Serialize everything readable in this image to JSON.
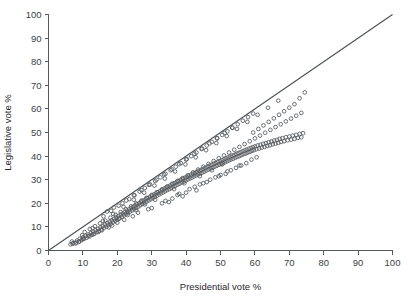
{
  "chart_data": {
    "type": "scatter",
    "title": "",
    "xlabel": "Presidential vote %",
    "ylabel": "Legislative vote %",
    "xlim": [
      0,
      100
    ],
    "ylim": [
      0,
      100
    ],
    "grid": false,
    "legend": null,
    "xticks": [
      0,
      10,
      20,
      30,
      40,
      50,
      60,
      70,
      80,
      90,
      100
    ],
    "yticks": [
      0,
      10,
      20,
      30,
      40,
      50,
      60,
      70,
      80,
      90,
      100
    ],
    "xtick_labels": [
      "0",
      "10",
      "20",
      "30",
      "40",
      "50",
      "60",
      "70",
      "80",
      "90",
      "100"
    ],
    "ytick_labels": [
      "0",
      "10",
      "20",
      "30",
      "40",
      "50",
      "60",
      "70",
      "80",
      "90",
      "100"
    ],
    "annotations": [
      {
        "name": "identity-line",
        "description": "45 degree reference line y = x",
        "from": [
          0,
          0
        ],
        "to": [
          100,
          100
        ]
      }
    ],
    "marker": "open-circle",
    "marker_color": "#54585c",
    "points": [
      [
        6.4,
        2.6
      ],
      [
        7.2,
        3.1
      ],
      [
        7.9,
        3.0
      ],
      [
        8.3,
        4.2
      ],
      [
        8.8,
        3.6
      ],
      [
        9.1,
        5.0
      ],
      [
        9.6,
        4.4
      ],
      [
        10.0,
        5.6
      ],
      [
        10.3,
        4.9
      ],
      [
        10.8,
        6.2
      ],
      [
        11.1,
        5.4
      ],
      [
        11.6,
        6.8
      ],
      [
        11.9,
        6.0
      ],
      [
        12.3,
        7.4
      ],
      [
        12.6,
        6.6
      ],
      [
        13.0,
        8.0
      ],
      [
        13.3,
        7.1
      ],
      [
        13.7,
        8.6
      ],
      [
        14.0,
        7.7
      ],
      [
        14.4,
        9.2
      ],
      [
        14.7,
        8.3
      ],
      [
        15.1,
        9.8
      ],
      [
        15.4,
        8.9
      ],
      [
        15.8,
        10.4
      ],
      [
        16.1,
        9.5
      ],
      [
        16.4,
        11.0
      ],
      [
        16.8,
        10.1
      ],
      [
        17.1,
        11.6
      ],
      [
        17.4,
        10.7
      ],
      [
        17.8,
        12.2
      ],
      [
        18.1,
        11.3
      ],
      [
        18.4,
        12.8
      ],
      [
        18.7,
        11.9
      ],
      [
        19.1,
        13.4
      ],
      [
        19.4,
        12.5
      ],
      [
        19.7,
        14.0
      ],
      [
        20.0,
        13.1
      ],
      [
        20.3,
        14.6
      ],
      [
        20.6,
        13.6
      ],
      [
        21.0,
        15.2
      ],
      [
        21.3,
        14.2
      ],
      [
        21.6,
        15.7
      ],
      [
        21.9,
        14.8
      ],
      [
        22.2,
        16.3
      ],
      [
        22.5,
        15.4
      ],
      [
        22.8,
        16.9
      ],
      [
        23.1,
        15.9
      ],
      [
        23.4,
        17.4
      ],
      [
        23.7,
        16.5
      ],
      [
        24.0,
        18.0
      ],
      [
        24.3,
        17.0
      ],
      [
        24.6,
        18.5
      ],
      [
        24.9,
        17.6
      ],
      [
        25.2,
        19.1
      ],
      [
        25.5,
        18.1
      ],
      [
        25.8,
        19.6
      ],
      [
        26.1,
        18.6
      ],
      [
        26.4,
        20.1
      ],
      [
        26.7,
        19.2
      ],
      [
        27.0,
        20.7
      ],
      [
        27.3,
        19.7
      ],
      [
        27.6,
        21.2
      ],
      [
        27.9,
        20.2
      ],
      [
        28.2,
        21.7
      ],
      [
        28.5,
        20.7
      ],
      [
        28.8,
        22.2
      ],
      [
        29.1,
        21.2
      ],
      [
        29.4,
        22.7
      ],
      [
        29.7,
        21.7
      ],
      [
        30.0,
        23.2
      ],
      [
        30.3,
        22.2
      ],
      [
        30.6,
        23.7
      ],
      [
        30.9,
        22.7
      ],
      [
        31.2,
        24.2
      ],
      [
        31.5,
        23.2
      ],
      [
        31.8,
        24.7
      ],
      [
        32.1,
        23.7
      ],
      [
        32.4,
        25.2
      ],
      [
        32.7,
        24.2
      ],
      [
        33.0,
        25.7
      ],
      [
        33.3,
        24.6
      ],
      [
        33.6,
        26.2
      ],
      [
        33.9,
        25.1
      ],
      [
        34.2,
        26.7
      ],
      [
        34.5,
        25.6
      ],
      [
        34.8,
        27.1
      ],
      [
        35.1,
        26.0
      ],
      [
        35.4,
        27.6
      ],
      [
        35.7,
        26.5
      ],
      [
        36.0,
        28.1
      ],
      [
        36.3,
        27.0
      ],
      [
        36.6,
        28.5
      ],
      [
        36.9,
        27.4
      ],
      [
        37.2,
        29.0
      ],
      [
        37.5,
        27.9
      ],
      [
        37.8,
        29.4
      ],
      [
        38.1,
        28.3
      ],
      [
        38.4,
        29.9
      ],
      [
        38.7,
        28.8
      ],
      [
        39.0,
        30.3
      ],
      [
        39.3,
        29.2
      ],
      [
        39.6,
        30.8
      ],
      [
        39.9,
        29.6
      ],
      [
        40.2,
        31.2
      ],
      [
        40.5,
        30.1
      ],
      [
        40.8,
        31.6
      ],
      [
        41.1,
        30.5
      ],
      [
        41.4,
        32.1
      ],
      [
        41.7,
        30.9
      ],
      [
        42.0,
        32.5
      ],
      [
        42.3,
        31.4
      ],
      [
        42.6,
        32.9
      ],
      [
        42.9,
        31.8
      ],
      [
        43.2,
        33.4
      ],
      [
        43.5,
        32.2
      ],
      [
        43.8,
        33.8
      ],
      [
        44.1,
        32.6
      ],
      [
        44.4,
        34.2
      ],
      [
        44.7,
        33.0
      ],
      [
        45.0,
        34.6
      ],
      [
        45.3,
        33.4
      ],
      [
        45.6,
        35.0
      ],
      [
        45.9,
        33.9
      ],
      [
        46.2,
        35.5
      ],
      [
        46.5,
        34.3
      ],
      [
        46.8,
        35.9
      ],
      [
        47.1,
        34.7
      ],
      [
        47.4,
        36.3
      ],
      [
        47.7,
        35.1
      ],
      [
        48.0,
        36.7
      ],
      [
        48.3,
        35.5
      ],
      [
        48.6,
        37.1
      ],
      [
        48.9,
        35.9
      ],
      [
        49.2,
        37.5
      ],
      [
        49.5,
        36.3
      ],
      [
        49.8,
        37.9
      ],
      [
        50.1,
        36.7
      ],
      [
        50.4,
        38.3
      ],
      [
        50.7,
        37.0
      ],
      [
        51.0,
        38.6
      ],
      [
        51.3,
        37.4
      ],
      [
        51.6,
        39.0
      ],
      [
        51.9,
        37.8
      ],
      [
        52.2,
        39.4
      ],
      [
        52.5,
        38.2
      ],
      [
        52.8,
        39.8
      ],
      [
        53.1,
        38.6
      ],
      [
        53.4,
        40.2
      ],
      [
        53.7,
        38.9
      ],
      [
        54.0,
        40.5
      ],
      [
        54.3,
        39.3
      ],
      [
        54.6,
        40.9
      ],
      [
        54.9,
        39.7
      ],
      [
        55.2,
        41.3
      ],
      [
        55.5,
        40.0
      ],
      [
        55.8,
        41.6
      ],
      [
        56.1,
        40.4
      ],
      [
        56.4,
        42.0
      ],
      [
        56.7,
        40.8
      ],
      [
        57.0,
        42.4
      ],
      [
        57.3,
        41.1
      ],
      [
        57.6,
        42.7
      ],
      [
        57.9,
        41.5
      ],
      [
        58.2,
        43.1
      ],
      [
        58.5,
        41.8
      ],
      [
        58.8,
        43.4
      ],
      [
        59.1,
        42.2
      ],
      [
        59.4,
        43.8
      ],
      [
        59.7,
        42.5
      ],
      [
        60.0,
        44.1
      ],
      [
        60.4,
        42.9
      ],
      [
        60.8,
        44.5
      ],
      [
        61.2,
        43.2
      ],
      [
        61.6,
        44.8
      ],
      [
        62.0,
        43.6
      ],
      [
        62.4,
        45.2
      ],
      [
        62.8,
        43.9
      ],
      [
        63.2,
        45.5
      ],
      [
        63.6,
        44.3
      ],
      [
        64.0,
        45.9
      ],
      [
        64.4,
        44.6
      ],
      [
        64.8,
        46.2
      ],
      [
        65.2,
        45.0
      ],
      [
        65.6,
        46.6
      ],
      [
        66.0,
        45.3
      ],
      [
        66.4,
        46.9
      ],
      [
        66.8,
        45.6
      ],
      [
        67.2,
        47.3
      ],
      [
        67.6,
        46.0
      ],
      [
        68.0,
        47.6
      ],
      [
        68.5,
        46.3
      ],
      [
        69.0,
        48.0
      ],
      [
        69.5,
        46.7
      ],
      [
        70.0,
        48.3
      ],
      [
        70.5,
        47.0
      ],
      [
        71.0,
        48.7
      ],
      [
        71.5,
        47.3
      ],
      [
        72.0,
        49.0
      ],
      [
        72.5,
        47.7
      ],
      [
        73.0,
        49.4
      ],
      [
        73.5,
        48.0
      ],
      [
        74.0,
        49.7
      ],
      [
        10.5,
        7.8
      ],
      [
        12.0,
        9.1
      ],
      [
        13.5,
        10.3
      ],
      [
        15.0,
        11.5
      ],
      [
        16.5,
        12.7
      ],
      [
        18.0,
        13.9
      ],
      [
        19.5,
        15.1
      ],
      [
        21.0,
        16.3
      ],
      [
        22.5,
        17.5
      ],
      [
        24.0,
        18.7
      ],
      [
        25.5,
        19.9
      ],
      [
        27.0,
        21.1
      ],
      [
        28.5,
        22.3
      ],
      [
        30.0,
        23.5
      ],
      [
        31.5,
        24.7
      ],
      [
        33.0,
        25.9
      ],
      [
        34.5,
        27.1
      ],
      [
        36.0,
        28.3
      ],
      [
        37.5,
        29.5
      ],
      [
        39.0,
        30.7
      ],
      [
        40.5,
        31.9
      ],
      [
        42.0,
        33.1
      ],
      [
        43.5,
        34.3
      ],
      [
        45.0,
        35.5
      ],
      [
        46.5,
        36.7
      ],
      [
        48.0,
        37.9
      ],
      [
        49.5,
        39.1
      ],
      [
        51.0,
        40.3
      ],
      [
        52.5,
        41.5
      ],
      [
        54.0,
        42.7
      ],
      [
        55.5,
        43.9
      ],
      [
        57.0,
        45.1
      ],
      [
        58.5,
        46.3
      ],
      [
        60.0,
        47.5
      ],
      [
        61.5,
        48.7
      ],
      [
        63.0,
        49.9
      ],
      [
        64.5,
        51.1
      ],
      [
        66.0,
        52.3
      ],
      [
        67.5,
        53.5
      ],
      [
        69.0,
        54.7
      ],
      [
        70.5,
        55.9
      ],
      [
        72.0,
        57.1
      ],
      [
        73.5,
        58.3
      ],
      [
        74.5,
        67.0
      ],
      [
        73.0,
        64.5
      ],
      [
        71.5,
        62.0
      ],
      [
        70.0,
        60.5
      ],
      [
        68.5,
        59.0
      ],
      [
        67.0,
        57.5
      ],
      [
        65.5,
        56.0
      ],
      [
        64.0,
        54.5
      ],
      [
        62.5,
        53.0
      ],
      [
        61.0,
        51.5
      ],
      [
        59.5,
        50.0
      ],
      [
        17.0,
        16.5
      ],
      [
        19.0,
        18.2
      ],
      [
        21.5,
        20.0
      ],
      [
        23.5,
        21.8
      ],
      [
        25.0,
        23.4
      ],
      [
        26.5,
        25.0
      ],
      [
        28.0,
        26.5
      ],
      [
        29.5,
        28.0
      ],
      [
        31.0,
        29.5
      ],
      [
        32.5,
        31.0
      ],
      [
        34.0,
        32.5
      ],
      [
        35.5,
        34.0
      ],
      [
        37.0,
        35.5
      ],
      [
        38.5,
        37.0
      ],
      [
        40.0,
        38.5
      ],
      [
        41.5,
        40.0
      ],
      [
        43.0,
        41.5
      ],
      [
        44.5,
        43.0
      ],
      [
        46.0,
        44.5
      ],
      [
        47.5,
        46.0
      ],
      [
        49.0,
        47.5
      ],
      [
        50.5,
        49.0
      ],
      [
        52.0,
        50.5
      ],
      [
        53.5,
        52.0
      ],
      [
        55.0,
        53.5
      ],
      [
        56.5,
        55.0
      ],
      [
        58.0,
        56.5
      ],
      [
        59.5,
        58.0
      ],
      [
        30.0,
        18.0
      ],
      [
        33.0,
        20.0
      ],
      [
        36.0,
        22.0
      ],
      [
        38.0,
        24.0
      ],
      [
        41.0,
        26.0
      ],
      [
        44.0,
        28.0
      ],
      [
        47.0,
        30.0
      ],
      [
        50.0,
        32.0
      ],
      [
        53.0,
        34.0
      ],
      [
        56.0,
        36.0
      ],
      [
        45.0,
        28.5
      ],
      [
        48.5,
        31.0
      ],
      [
        52.0,
        33.5
      ],
      [
        55.5,
        36.0
      ],
      [
        59.0,
        38.5
      ],
      [
        35.0,
        20.5
      ],
      [
        39.0,
        23.0
      ],
      [
        43.0,
        25.5
      ],
      [
        26.0,
        16.0
      ],
      [
        29.0,
        17.5
      ],
      [
        22.0,
        13.0
      ],
      [
        24.5,
        14.5
      ],
      [
        20.0,
        11.8
      ],
      [
        18.5,
        10.6
      ],
      [
        17.5,
        9.8
      ],
      [
        15.5,
        8.6
      ],
      [
        14.5,
        7.9
      ],
      [
        13.0,
        6.9
      ],
      [
        11.5,
        6.0
      ],
      [
        10.0,
        4.9
      ],
      [
        9.0,
        3.9
      ],
      [
        8.0,
        3.4
      ],
      [
        7.0,
        2.9
      ],
      [
        6.8,
        3.8
      ],
      [
        9.8,
        6.5
      ],
      [
        12.8,
        9.5
      ],
      [
        15.8,
        12.5
      ],
      [
        18.8,
        15.5
      ],
      [
        21.8,
        18.5
      ],
      [
        24.8,
        21.5
      ],
      [
        27.8,
        24.5
      ],
      [
        30.8,
        27.5
      ],
      [
        33.8,
        30.5
      ],
      [
        36.8,
        33.5
      ],
      [
        39.8,
        36.5
      ],
      [
        42.8,
        39.5
      ],
      [
        45.8,
        42.5
      ],
      [
        48.8,
        45.5
      ],
      [
        51.8,
        48.5
      ],
      [
        54.8,
        51.5
      ],
      [
        57.8,
        54.5
      ],
      [
        60.8,
        57.5
      ],
      [
        63.8,
        60.5
      ],
      [
        66.8,
        63.5
      ],
      [
        16.0,
        14.5
      ],
      [
        18.2,
        16.8
      ],
      [
        20.4,
        19.0
      ],
      [
        22.6,
        21.2
      ],
      [
        24.8,
        23.4
      ],
      [
        27.0,
        25.6
      ],
      [
        29.2,
        27.8
      ],
      [
        31.4,
        30.0
      ],
      [
        33.6,
        32.2
      ],
      [
        35.8,
        34.4
      ],
      [
        38.0,
        36.6
      ],
      [
        40.2,
        38.8
      ],
      [
        42.4,
        41.0
      ],
      [
        44.6,
        43.2
      ],
      [
        46.8,
        45.4
      ],
      [
        49.0,
        47.6
      ],
      [
        51.2,
        49.8
      ],
      [
        53.4,
        52.0
      ],
      [
        34.0,
        21.0
      ],
      [
        37.5,
        23.5
      ],
      [
        40.0,
        24.5
      ],
      [
        42.5,
        27.0
      ],
      [
        46.0,
        29.0
      ],
      [
        49.5,
        31.5
      ],
      [
        51.5,
        32.5
      ],
      [
        54.5,
        35.0
      ],
      [
        57.5,
        37.0
      ],
      [
        60.5,
        39.5
      ],
      [
        36.5,
        26.0
      ],
      [
        39.5,
        28.5
      ],
      [
        44.0,
        31.5
      ],
      [
        47.5,
        34.0
      ],
      [
        50.5,
        36.5
      ],
      [
        31.0,
        21.5
      ],
      [
        28.0,
        19.5
      ],
      [
        25.5,
        17.0
      ],
      [
        23.0,
        15.0
      ],
      [
        20.5,
        13.5
      ]
    ]
  }
}
